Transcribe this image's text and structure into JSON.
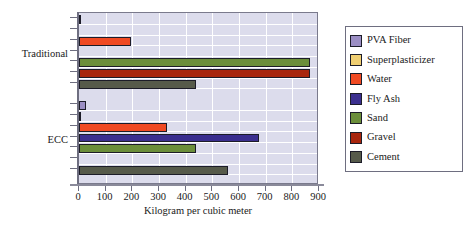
{
  "chart_data": {
    "type": "bar",
    "orientation": "horizontal",
    "title": "",
    "xlabel": "Kilogram per cubic meter",
    "ylabel": "",
    "xlim": [
      0,
      900
    ],
    "xticks": [
      0,
      100,
      200,
      300,
      400,
      500,
      600,
      700,
      800,
      900
    ],
    "xtick_labels": [
      "0",
      "100",
      "200",
      "300",
      "400",
      "500",
      "600",
      "700",
      "800",
      "900"
    ],
    "categories": [
      "Traditional",
      "ECC"
    ],
    "grid": "vertical and horizontal white gridlines",
    "legend_position": "right outside",
    "series": [
      {
        "name": "PVA Fiber",
        "color": "#9b8ec4",
        "values": {
          "Traditional": 4,
          "ECC": 26
        }
      },
      {
        "name": "Superplasticizer",
        "color": "#f0cf72",
        "values": {
          "Traditional": 0,
          "ECC": 7
        }
      },
      {
        "name": "Water",
        "color": "#f04a23",
        "values": {
          "Traditional": 195,
          "ECC": 330
        }
      },
      {
        "name": "Fly Ash",
        "color": "#3b2f8f",
        "values": {
          "Traditional": 0,
          "ECC": 675
        }
      },
      {
        "name": "Sand",
        "color": "#6b8e3a",
        "values": {
          "Traditional": 866,
          "ECC": 440
        }
      },
      {
        "name": "Gravel",
        "color": "#a8260d",
        "values": {
          "Traditional": 866,
          "ECC": 0
        }
      },
      {
        "name": "Cement",
        "color": "#565a4a",
        "values": {
          "Traditional": 440,
          "ECC": 560
        }
      }
    ]
  },
  "legend": {
    "entries": [
      {
        "label": "PVA Fiber",
        "color": "#9b8ec4"
      },
      {
        "label": "Superplasticizer",
        "color": "#f0cf72"
      },
      {
        "label": "Water",
        "color": "#f04a23"
      },
      {
        "label": "Fly Ash",
        "color": "#3b2f8f"
      },
      {
        "label": "Sand",
        "color": "#6b8e3a"
      },
      {
        "label": "Gravel",
        "color": "#a8260d"
      },
      {
        "label": "Cement",
        "color": "#565a4a"
      }
    ]
  },
  "axis": {
    "x_title": "Kilogram per cubic meter",
    "category_labels": [
      "Traditional",
      "ECC"
    ]
  },
  "colors": {
    "plot_background": "#dcdcec",
    "gridline": "#ffffff",
    "axis": "#6e6e80",
    "text": "#1a1a1a",
    "page_background": "#ffffff"
  }
}
